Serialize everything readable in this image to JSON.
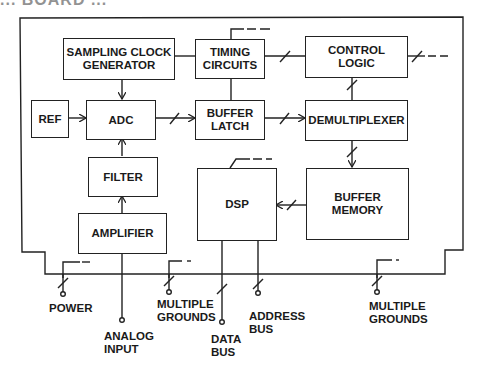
{
  "diagram": {
    "clipped_title": "... BOARD ...",
    "blocks": {
      "sampling_clock": "SAMPLING CLOCK\nGENERATOR",
      "timing": "TIMING\nCIRCUITS",
      "control": "CONTROL\nLOGIC",
      "ref": "REF",
      "adc": "ADC",
      "buffer_latch": "BUFFER\nLATCH",
      "demux": "DEMULTIPLEXER",
      "filter": "FILTER",
      "dsp": "DSP",
      "buffer_memory": "BUFFER\nMEMORY",
      "amplifier": "AMPLIFIER"
    },
    "terminals": {
      "power": "POWER",
      "analog_input": "ANALOG\nINPUT",
      "multiple_grounds_1": "MULTIPLE\nGROUNDS",
      "data_bus": "DATA\nBUS",
      "address_bus": "ADDRESS\nBUS",
      "multiple_grounds_2": "MULTIPLE\nGROUNDS"
    }
  }
}
